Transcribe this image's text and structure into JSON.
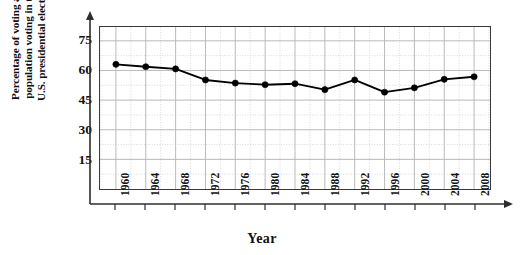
{
  "chart_data": {
    "type": "line",
    "title": "",
    "xlabel": "Year",
    "ylabel": "Percentage of voting age population voting in the U.S. presidential election",
    "ylabel_lines": [
      "Percentage of voting age",
      "population voting in the",
      "U.S. presidential election"
    ],
    "categories": [
      "1960",
      "1964",
      "1968",
      "1972",
      "1976",
      "1980",
      "1984",
      "1988",
      "1992",
      "1996",
      "2000",
      "2004",
      "2008"
    ],
    "x": [
      1960,
      1964,
      1968,
      1972,
      1976,
      1980,
      1984,
      1988,
      1992,
      1996,
      2000,
      2004,
      2008
    ],
    "values": [
      63.1,
      61.9,
      60.8,
      55.2,
      53.6,
      52.8,
      53.3,
      50.3,
      55.2,
      49.0,
      51.2,
      55.5,
      56.8
    ],
    "yticks": [
      15,
      30,
      45,
      60,
      75
    ],
    "ylim": [
      0,
      82
    ],
    "xlim": [
      1958,
      2010
    ],
    "grid": true,
    "grid_minor": true,
    "legend": "none",
    "marker": "filled-circle",
    "line_color": "#000000",
    "marker_color": "#000000",
    "grid_color": "#b9b9b9",
    "grid_minor_color": "#d9d9d9",
    "axis_color": "#2e2e2e"
  },
  "axis": {
    "x_title": "Year",
    "y_tick_labels": [
      "75",
      "60",
      "45",
      "30",
      "15"
    ],
    "x_tick_labels": [
      "1960",
      "1964",
      "1968",
      "1972",
      "1976",
      "1980",
      "1984",
      "1988",
      "1992",
      "1996",
      "2000",
      "2004",
      "2008"
    ]
  }
}
